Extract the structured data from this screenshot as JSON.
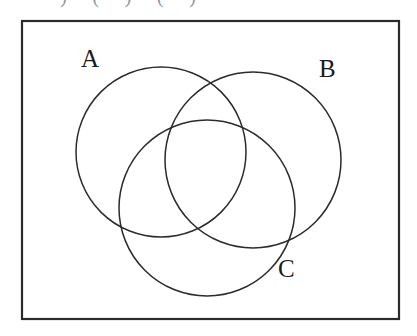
{
  "figure": {
    "kind": "venn-diagram",
    "background_color": "#ffffff",
    "stroke_color": "#2b2b2b",
    "label_color": "#1b1b1b",
    "width": 417,
    "height": 336
  },
  "clipped_text": {
    "visible_fragment": ") (   ) (   )",
    "note_color": "#9a9a9a"
  },
  "border": {
    "name": "universal-set-rectangle",
    "x": 22,
    "y": 21,
    "width": 377,
    "height": 298,
    "stroke_width": 2.2
  },
  "labels": {
    "a": "A",
    "b": "B",
    "c": "C"
  },
  "chart_data": {
    "type": "diagram",
    "title": "",
    "shape": "three-set Venn diagram",
    "sets": [
      {
        "name": "A",
        "label": "A",
        "cx": 161,
        "cy": 152,
        "r": 85,
        "label_x": 92,
        "label_y": 59
      },
      {
        "name": "B",
        "label": "B",
        "cx": 253,
        "cy": 160,
        "r": 88,
        "label_x": 330,
        "label_y": 69
      },
      {
        "name": "C",
        "label": "C",
        "cx": 207,
        "cy": 208,
        "r": 88,
        "label_x": 289,
        "label_y": 269
      }
    ],
    "stroke_width": 1.5,
    "fill": "none",
    "regions": 8,
    "legend": "none",
    "grid": false
  }
}
